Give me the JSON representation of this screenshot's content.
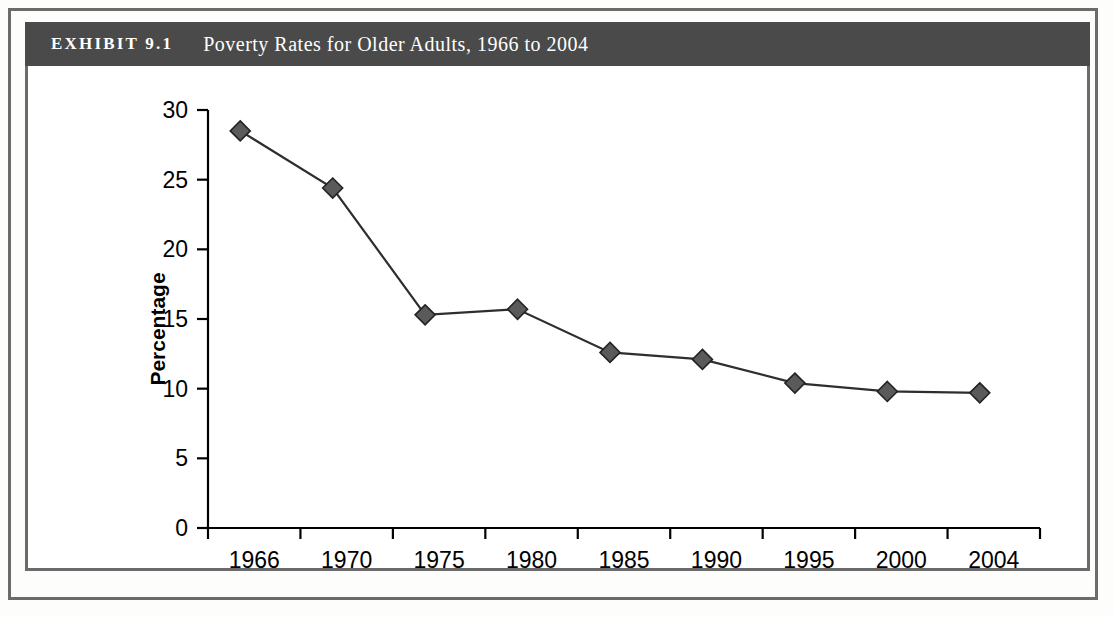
{
  "exhibit": {
    "number_label": "EXHIBIT 9.1",
    "title": "Poverty Rates for Older Adults, 1966 to 2004"
  },
  "chart_data": {
    "type": "line",
    "title": "Poverty Rates for Older Adults, 1966 to 2004",
    "categories": [
      "1966",
      "1970",
      "1975",
      "1980",
      "1985",
      "1990",
      "1995",
      "2000",
      "2004"
    ],
    "values": [
      28.5,
      24.4,
      15.3,
      15.7,
      12.6,
      12.1,
      10.4,
      9.8,
      9.7
    ],
    "series": [
      {
        "name": "Poverty rate",
        "values": [
          28.5,
          24.4,
          15.3,
          15.7,
          12.6,
          12.1,
          10.4,
          9.8,
          9.7
        ]
      }
    ],
    "xlabel": "",
    "ylabel": "Percentage",
    "ylim": [
      0,
      30
    ],
    "yticks": [
      "0",
      "5",
      "10",
      "15",
      "20",
      "25",
      "30"
    ],
    "ytick_values": [
      0,
      5,
      10,
      15,
      20,
      25,
      30
    ],
    "xticks": [
      "1966",
      "1970",
      "1975",
      "1980",
      "1985",
      "1990",
      "1995",
      "2000",
      "2004"
    ],
    "grid": false,
    "legend": false,
    "marker": "diamond",
    "marker_color": "#5a5a5a",
    "line_color": "#2e2e2e"
  },
  "colors": {
    "header_band": "#4a4a4a",
    "frame": "#6b6b6b",
    "panel_background": "#ffffff",
    "marker_fill": "#5a5a5a",
    "line": "#2e2e2e"
  }
}
